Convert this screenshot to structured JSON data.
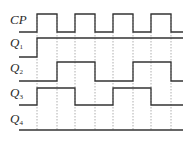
{
  "diagram": {
    "type": "timing-diagram",
    "colors": {
      "waveform": "#333333",
      "guide": "#9a9a9a",
      "background": "#ffffff"
    },
    "x_start": 19,
    "x_end": 183,
    "edges_x": [
      37,
      57,
      75,
      95,
      113,
      133,
      151,
      171
    ],
    "guide_top": 14,
    "guide_bottom": 130,
    "signals": [
      {
        "id": "cp",
        "name": "CP",
        "subscript": "",
        "label_y": 17,
        "high_y": 14,
        "low_y": 32,
        "initial": 0,
        "transitions": [
          37,
          57,
          75,
          95,
          113,
          133,
          151,
          171
        ]
      },
      {
        "id": "q1",
        "name": "Q",
        "subscript": "1",
        "label_y": 42,
        "high_y": 38,
        "low_y": 57,
        "initial": 0,
        "transitions": [
          37
        ]
      },
      {
        "id": "q2",
        "name": "Q",
        "subscript": "2",
        "label_y": 67,
        "high_y": 62,
        "low_y": 81,
        "initial": 0,
        "transitions": [
          57,
          95,
          133,
          171
        ]
      },
      {
        "id": "q3",
        "name": "Q",
        "subscript": "3",
        "label_y": 92,
        "high_y": 88,
        "low_y": 105,
        "initial": 0,
        "transitions": [
          37,
          75,
          113,
          151
        ]
      },
      {
        "id": "q4",
        "name": "Q",
        "subscript": "4",
        "label_y": 118,
        "high_y": 113,
        "low_y": 130,
        "initial": 0,
        "transitions": []
      }
    ]
  }
}
